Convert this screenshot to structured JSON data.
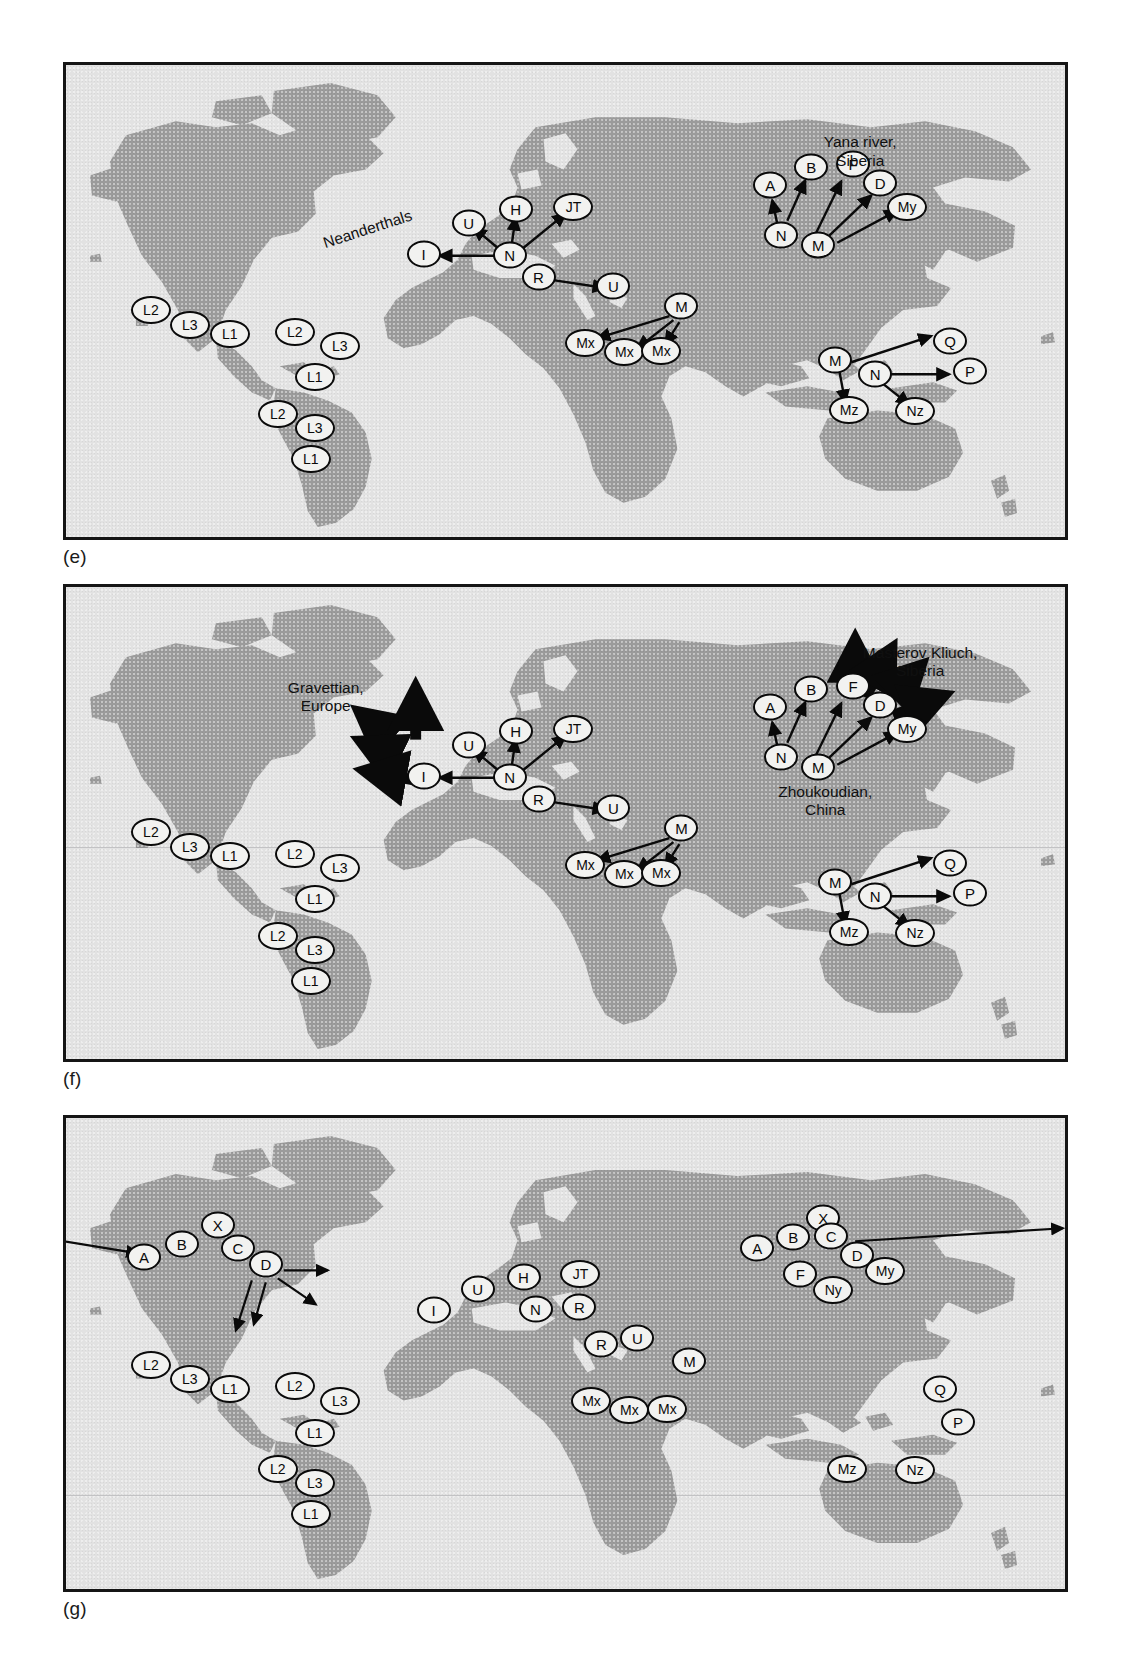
{
  "figure": {
    "panels": [
      {
        "id": "e",
        "label": "(e)",
        "annotations": [
          {
            "name": "yana-river-siberia",
            "text": "Yana river,\nSiberia",
            "x": 79.5,
            "y": 14.5,
            "rotate": 0
          },
          {
            "name": "neanderthals",
            "text": "Neanderthals",
            "x": 25.5,
            "y": 36.0,
            "rotate": -18
          }
        ],
        "nodes": [
          {
            "label": "A",
            "x": 70.5,
            "y": 25.5,
            "w": 1
          },
          {
            "label": "B",
            "x": 74.6,
            "y": 21.7,
            "w": 1
          },
          {
            "label": "F",
            "x": 78.8,
            "y": 21.0,
            "w": 1
          },
          {
            "label": "D",
            "x": 81.5,
            "y": 25.0,
            "w": 1
          },
          {
            "label": "My",
            "x": 84.2,
            "y": 30.0,
            "w": 2
          },
          {
            "label": "N",
            "x": 71.6,
            "y": 36.0,
            "w": 1
          },
          {
            "label": "M",
            "x": 75.3,
            "y": 38.2,
            "w": 1
          },
          {
            "label": "U",
            "x": 40.3,
            "y": 33.4,
            "w": 1
          },
          {
            "label": "H",
            "x": 45.0,
            "y": 30.5,
            "w": 1
          },
          {
            "label": "JT",
            "x": 50.8,
            "y": 30.0,
            "w": 2
          },
          {
            "label": "I",
            "x": 35.8,
            "y": 40.0,
            "w": 1
          },
          {
            "label": "N",
            "x": 44.4,
            "y": 40.3,
            "w": 1
          },
          {
            "label": "R",
            "x": 47.3,
            "y": 45.0,
            "w": 1
          },
          {
            "label": "U",
            "x": 54.8,
            "y": 46.8,
            "w": 1
          },
          {
            "label": "M",
            "x": 61.6,
            "y": 51.0,
            "w": 1
          },
          {
            "label": "Mx",
            "x": 52.0,
            "y": 58.8,
            "w": 2
          },
          {
            "label": "Mx",
            "x": 55.9,
            "y": 60.8,
            "w": 2
          },
          {
            "label": "Mx",
            "x": 59.6,
            "y": 60.5,
            "w": 2
          },
          {
            "label": "L2",
            "x": 8.5,
            "y": 52.0,
            "w": 2
          },
          {
            "label": "L3",
            "x": 12.4,
            "y": 55.0,
            "w": 2
          },
          {
            "label": "L1",
            "x": 16.4,
            "y": 57.0,
            "w": 2
          },
          {
            "label": "L2",
            "x": 22.9,
            "y": 56.5,
            "w": 2
          },
          {
            "label": "L3",
            "x": 27.4,
            "y": 59.5,
            "w": 2
          },
          {
            "label": "L1",
            "x": 24.9,
            "y": 66.2,
            "w": 2
          },
          {
            "label": "L2",
            "x": 21.2,
            "y": 74.0,
            "w": 2
          },
          {
            "label": "L3",
            "x": 24.9,
            "y": 77.0,
            "w": 2
          },
          {
            "label": "L1",
            "x": 24.5,
            "y": 83.5,
            "w": 2
          },
          {
            "label": "M",
            "x": 77.0,
            "y": 62.5,
            "w": 1
          },
          {
            "label": "N",
            "x": 81.0,
            "y": 65.5,
            "w": 1
          },
          {
            "label": "Q",
            "x": 88.5,
            "y": 58.5,
            "w": 1
          },
          {
            "label": "P",
            "x": 90.5,
            "y": 64.8,
            "w": 1
          },
          {
            "label": "Mz",
            "x": 78.4,
            "y": 73.0,
            "w": 2
          },
          {
            "label": "Nz",
            "x": 85.0,
            "y": 73.2,
            "w": 2
          }
        ]
      },
      {
        "id": "f",
        "label": "(f)",
        "annotations": [
          {
            "name": "masterov-kliuch-siberia",
            "text": "Masterov Kliuch,\nSiberia",
            "x": 85.5,
            "y": 12.0,
            "rotate": 0
          },
          {
            "name": "gravettian-europe",
            "text": "Gravettian,\nEurope",
            "x": 26.0,
            "y": 19.5,
            "rotate": 0
          },
          {
            "name": "zhoukoudian-china",
            "text": "Zhoukoudian,\nChina",
            "x": 76.0,
            "y": 41.5,
            "rotate": 0
          }
        ],
        "nodes": [
          {
            "label": "A",
            "x": 70.5,
            "y": 25.5,
            "w": 1
          },
          {
            "label": "B",
            "x": 74.6,
            "y": 21.7,
            "w": 1
          },
          {
            "label": "F",
            "x": 78.8,
            "y": 21.0,
            "w": 1
          },
          {
            "label": "D",
            "x": 81.5,
            "y": 25.0,
            "w": 1
          },
          {
            "label": "My",
            "x": 84.2,
            "y": 30.0,
            "w": 2
          },
          {
            "label": "N",
            "x": 71.6,
            "y": 36.0,
            "w": 1
          },
          {
            "label": "M",
            "x": 75.3,
            "y": 38.2,
            "w": 1
          },
          {
            "label": "U",
            "x": 40.3,
            "y": 33.4,
            "w": 1
          },
          {
            "label": "H",
            "x": 45.0,
            "y": 30.5,
            "w": 1
          },
          {
            "label": "JT",
            "x": 50.8,
            "y": 30.0,
            "w": 2
          },
          {
            "label": "I",
            "x": 35.8,
            "y": 40.0,
            "w": 1
          },
          {
            "label": "N",
            "x": 44.4,
            "y": 40.3,
            "w": 1
          },
          {
            "label": "R",
            "x": 47.3,
            "y": 45.0,
            "w": 1
          },
          {
            "label": "U",
            "x": 54.8,
            "y": 46.8,
            "w": 1
          },
          {
            "label": "M",
            "x": 61.6,
            "y": 51.0,
            "w": 1
          },
          {
            "label": "Mx",
            "x": 52.0,
            "y": 58.8,
            "w": 2
          },
          {
            "label": "Mx",
            "x": 55.9,
            "y": 60.8,
            "w": 2
          },
          {
            "label": "Mx",
            "x": 59.6,
            "y": 60.5,
            "w": 2
          },
          {
            "label": "L2",
            "x": 8.5,
            "y": 52.0,
            "w": 2
          },
          {
            "label": "L3",
            "x": 12.4,
            "y": 55.0,
            "w": 2
          },
          {
            "label": "L1",
            "x": 16.4,
            "y": 57.0,
            "w": 2
          },
          {
            "label": "L2",
            "x": 22.9,
            "y": 56.5,
            "w": 2
          },
          {
            "label": "L3",
            "x": 27.4,
            "y": 59.5,
            "w": 2
          },
          {
            "label": "L1",
            "x": 24.9,
            "y": 66.2,
            "w": 2
          },
          {
            "label": "L2",
            "x": 21.2,
            "y": 74.0,
            "w": 2
          },
          {
            "label": "L3",
            "x": 24.9,
            "y": 77.0,
            "w": 2
          },
          {
            "label": "L1",
            "x": 24.5,
            "y": 83.5,
            "w": 2
          },
          {
            "label": "M",
            "x": 77.0,
            "y": 62.5,
            "w": 1
          },
          {
            "label": "N",
            "x": 81.0,
            "y": 65.5,
            "w": 1
          },
          {
            "label": "Q",
            "x": 88.5,
            "y": 58.5,
            "w": 1
          },
          {
            "label": "P",
            "x": 90.5,
            "y": 64.8,
            "w": 1
          },
          {
            "label": "Mz",
            "x": 78.4,
            "y": 73.0,
            "w": 2
          },
          {
            "label": "Nz",
            "x": 85.0,
            "y": 73.2,
            "w": 2
          }
        ]
      },
      {
        "id": "g",
        "label": "(g)",
        "annotations": [],
        "nodes": [
          {
            "label": "A",
            "x": 7.8,
            "y": 29.5,
            "w": 1
          },
          {
            "label": "B",
            "x": 11.6,
            "y": 26.8,
            "w": 1
          },
          {
            "label": "X",
            "x": 15.2,
            "y": 22.8,
            "w": 1
          },
          {
            "label": "C",
            "x": 17.2,
            "y": 27.5,
            "w": 1
          },
          {
            "label": "D",
            "x": 20.0,
            "y": 31.0,
            "w": 1
          },
          {
            "label": "A",
            "x": 69.2,
            "y": 27.5,
            "w": 1
          },
          {
            "label": "B",
            "x": 72.8,
            "y": 25.2,
            "w": 1
          },
          {
            "label": "X",
            "x": 75.8,
            "y": 21.3,
            "w": 1
          },
          {
            "label": "C",
            "x": 76.6,
            "y": 25.0,
            "w": 1
          },
          {
            "label": "D",
            "x": 79.2,
            "y": 29.0,
            "w": 1
          },
          {
            "label": "My",
            "x": 82.0,
            "y": 32.5,
            "w": 2
          },
          {
            "label": "F",
            "x": 73.5,
            "y": 33.2,
            "w": 1
          },
          {
            "label": "Ny",
            "x": 76.8,
            "y": 36.5,
            "w": 2
          },
          {
            "label": "U",
            "x": 41.2,
            "y": 36.3,
            "w": 1
          },
          {
            "label": "H",
            "x": 45.8,
            "y": 33.8,
            "w": 1
          },
          {
            "label": "JT",
            "x": 51.5,
            "y": 33.2,
            "w": 2
          },
          {
            "label": "I",
            "x": 36.8,
            "y": 40.8,
            "w": 1
          },
          {
            "label": "N",
            "x": 47.0,
            "y": 40.5,
            "w": 1
          },
          {
            "label": "R",
            "x": 51.4,
            "y": 40.2,
            "w": 1
          },
          {
            "label": "R",
            "x": 53.6,
            "y": 48.0,
            "w": 1
          },
          {
            "label": "U",
            "x": 57.2,
            "y": 46.8,
            "w": 1
          },
          {
            "label": "M",
            "x": 62.4,
            "y": 51.5,
            "w": 1
          },
          {
            "label": "Mx",
            "x": 52.6,
            "y": 60.0,
            "w": 2
          },
          {
            "label": "Mx",
            "x": 56.4,
            "y": 62.0,
            "w": 2
          },
          {
            "label": "Mx",
            "x": 60.2,
            "y": 61.8,
            "w": 2
          },
          {
            "label": "L2",
            "x": 8.5,
            "y": 52.5,
            "w": 2
          },
          {
            "label": "L3",
            "x": 12.4,
            "y": 55.5,
            "w": 2
          },
          {
            "label": "L1",
            "x": 16.4,
            "y": 57.5,
            "w": 2
          },
          {
            "label": "L2",
            "x": 22.9,
            "y": 57.0,
            "w": 2
          },
          {
            "label": "L3",
            "x": 27.4,
            "y": 60.0,
            "w": 2
          },
          {
            "label": "L1",
            "x": 24.9,
            "y": 66.8,
            "w": 2
          },
          {
            "label": "L2",
            "x": 21.2,
            "y": 74.5,
            "w": 2
          },
          {
            "label": "L3",
            "x": 24.9,
            "y": 77.5,
            "w": 2
          },
          {
            "label": "L1",
            "x": 24.5,
            "y": 84.0,
            "w": 2
          },
          {
            "label": "Q",
            "x": 87.5,
            "y": 57.5,
            "w": 1
          },
          {
            "label": "P",
            "x": 89.3,
            "y": 64.5,
            "w": 1
          },
          {
            "label": "Mz",
            "x": 78.2,
            "y": 74.5,
            "w": 2
          },
          {
            "label": "Nz",
            "x": 85.0,
            "y": 74.8,
            "w": 2
          }
        ]
      }
    ],
    "colors": {
      "land": "#9b9b9b",
      "ocean": "#e2e2e2",
      "frame": "#151515",
      "node_fill": "#f2f2f0",
      "node_stroke": "#0a0a0a",
      "text": "#101010"
    }
  }
}
